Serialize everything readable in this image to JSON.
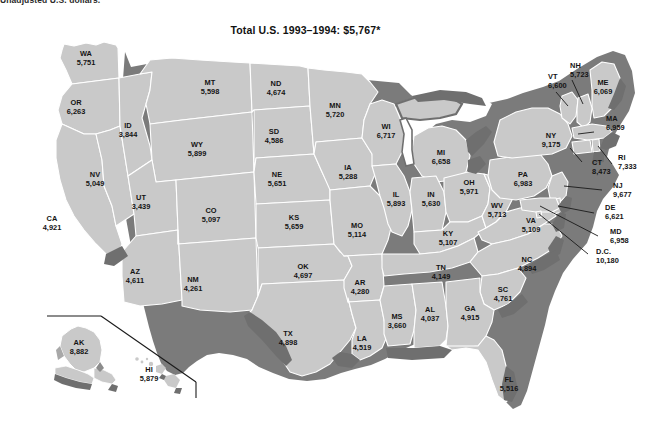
{
  "figure": {
    "footnote_top": "Unadjusted U.S. dollars.",
    "title": "Total U.S. 1993–1994: $5,767*",
    "total_us_value": "5,767",
    "period": "1993–1994",
    "units": "Unadjusted U.S. dollars"
  },
  "colors": {
    "state_fill": "#c9c9c9",
    "state_border": "#ffffff",
    "shadow": "#7b7b7b",
    "water": "#ffffff",
    "text": "#141414",
    "background": "#ffffff"
  },
  "chart_data": {
    "type": "map",
    "title": "Total U.S. 1993–1994: $5,767*",
    "subtitle": "Unadjusted U.S. dollars.",
    "region": "United States",
    "value_label": "Dollars per capita",
    "series_name": "1993–1994",
    "total_us": 5767,
    "min": 3439,
    "max": 10180,
    "categories": [
      "AL",
      "AK",
      "AZ",
      "AR",
      "CA",
      "CO",
      "CT",
      "DE",
      "D.C.",
      "FL",
      "GA",
      "HI",
      "ID",
      "IL",
      "IN",
      "IA",
      "KS",
      "KY",
      "LA",
      "ME",
      "MD",
      "MA",
      "MI",
      "MN",
      "MS",
      "MO",
      "MT",
      "NE",
      "NV",
      "NH",
      "NJ",
      "NM",
      "NY",
      "NC",
      "ND",
      "OH",
      "OK",
      "OR",
      "PA",
      "RI",
      "SC",
      "SD",
      "TN",
      "TX",
      "UT",
      "VT",
      "VA",
      "WA",
      "WV",
      "WI",
      "WY"
    ],
    "values": [
      4037,
      8882,
      4611,
      4280,
      4921,
      5097,
      8473,
      6621,
      10180,
      5516,
      4915,
      5879,
      3844,
      5893,
      5630,
      5288,
      5659,
      5107,
      4519,
      6069,
      6958,
      6959,
      6658,
      5720,
      3660,
      5114,
      5598,
      5651,
      5049,
      5723,
      9677,
      4261,
      9175,
      4894,
      4674,
      5971,
      4697,
      6263,
      6983,
      7333,
      4761,
      4586,
      4149,
      4898,
      3439,
      6600,
      5109,
      5751,
      5713,
      6717,
      5899
    ]
  },
  "states": [
    {
      "id": "WA",
      "abbr": "WA",
      "value": "5,751",
      "x": 86,
      "y": 59,
      "leader": false
    },
    {
      "id": "OR",
      "abbr": "OR",
      "value": "6,263",
      "x": 76,
      "y": 108,
      "leader": false
    },
    {
      "id": "CA",
      "abbr": "CA",
      "value": "4,921",
      "x": 52,
      "y": 224,
      "leader": false
    },
    {
      "id": "NV",
      "abbr": "NV",
      "value": "5,049",
      "x": 95,
      "y": 180,
      "leader": false
    },
    {
      "id": "ID",
      "abbr": "ID",
      "value": "3,844",
      "x": 128,
      "y": 131,
      "leader": false
    },
    {
      "id": "MT",
      "abbr": "MT",
      "value": "5,598",
      "x": 210,
      "y": 88,
      "leader": false
    },
    {
      "id": "WY",
      "abbr": "WY",
      "value": "5,899",
      "x": 197,
      "y": 150,
      "leader": false
    },
    {
      "id": "UT",
      "abbr": "UT",
      "value": "3,439",
      "x": 141,
      "y": 203,
      "leader": false
    },
    {
      "id": "AZ",
      "abbr": "AZ",
      "value": "4,611",
      "x": 135,
      "y": 277,
      "leader": false
    },
    {
      "id": "CO",
      "abbr": "CO",
      "value": "5,097",
      "x": 211,
      "y": 216,
      "leader": false
    },
    {
      "id": "NM",
      "abbr": "NM",
      "value": "4,261",
      "x": 193,
      "y": 285,
      "leader": false
    },
    {
      "id": "ND",
      "abbr": "ND",
      "value": "4,674",
      "x": 276,
      "y": 89,
      "leader": false
    },
    {
      "id": "SD",
      "abbr": "SD",
      "value": "4,586",
      "x": 274,
      "y": 137,
      "leader": false
    },
    {
      "id": "NE",
      "abbr": "NE",
      "value": "5,651",
      "x": 277,
      "y": 180,
      "leader": false
    },
    {
      "id": "KS",
      "abbr": "KS",
      "value": "5,659",
      "x": 294,
      "y": 223,
      "leader": false
    },
    {
      "id": "OK",
      "abbr": "OK",
      "value": "4,697",
      "x": 303,
      "y": 272,
      "leader": false
    },
    {
      "id": "TX",
      "abbr": "TX",
      "value": "4,898",
      "x": 288,
      "y": 339,
      "leader": false
    },
    {
      "id": "MN",
      "abbr": "MN",
      "value": "5,720",
      "x": 335,
      "y": 111,
      "leader": false
    },
    {
      "id": "IA",
      "abbr": "IA",
      "value": "5,288",
      "x": 348,
      "y": 173,
      "leader": false
    },
    {
      "id": "MO",
      "abbr": "MO",
      "value": "5,114",
      "x": 357,
      "y": 231,
      "leader": false
    },
    {
      "id": "AR",
      "abbr": "AR",
      "value": "4,280",
      "x": 360,
      "y": 288,
      "leader": false
    },
    {
      "id": "LA",
      "abbr": "LA",
      "value": "4,519",
      "x": 362,
      "y": 344,
      "leader": false
    },
    {
      "id": "WI",
      "abbr": "WI",
      "value": "6,717",
      "x": 386,
      "y": 132,
      "leader": false
    },
    {
      "id": "IL",
      "abbr": "IL",
      "value": "5,893",
      "x": 396,
      "y": 200,
      "leader": false
    },
    {
      "id": "MS",
      "abbr": "MS",
      "value": "3,660",
      "x": 397,
      "y": 322,
      "leader": false
    },
    {
      "id": "MI",
      "abbr": "MI",
      "value": "6,658",
      "x": 441,
      "y": 158,
      "leader": false
    },
    {
      "id": "IN",
      "abbr": "IN",
      "value": "5,630",
      "x": 431,
      "y": 200,
      "leader": false
    },
    {
      "id": "KY",
      "abbr": "KY",
      "value": "5,107",
      "x": 448,
      "y": 239,
      "leader": false
    },
    {
      "id": "TN",
      "abbr": "TN",
      "value": "4,149",
      "x": 441,
      "y": 273,
      "leader": false
    },
    {
      "id": "AL",
      "abbr": "AL",
      "value": "4,037",
      "x": 430,
      "y": 315,
      "leader": false
    },
    {
      "id": "OH",
      "abbr": "OH",
      "value": "5,971",
      "x": 469,
      "y": 188,
      "leader": false
    },
    {
      "id": "WV",
      "abbr": "WV",
      "value": "5,713",
      "x": 497,
      "y": 211,
      "leader": false
    },
    {
      "id": "GA",
      "abbr": "GA",
      "value": "4,915",
      "x": 470,
      "y": 314,
      "leader": false
    },
    {
      "id": "FL",
      "abbr": "FL",
      "value": "5,516",
      "x": 509,
      "y": 385,
      "leader": false
    },
    {
      "id": "SC",
      "abbr": "SC",
      "value": "4,761",
      "x": 503,
      "y": 295,
      "leader": false
    },
    {
      "id": "NC",
      "abbr": "NC",
      "value": "4,894",
      "x": 527,
      "y": 265,
      "leader": false
    },
    {
      "id": "VA",
      "abbr": "VA",
      "value": "5,109",
      "x": 531,
      "y": 226,
      "leader": false
    },
    {
      "id": "PA",
      "abbr": "PA",
      "value": "6,983",
      "x": 523,
      "y": 180,
      "leader": false
    },
    {
      "id": "NY",
      "abbr": "NY",
      "value": "9,175",
      "x": 551,
      "y": 141,
      "leader": false
    },
    {
      "id": "VT",
      "abbr": "VT",
      "value": "6,600",
      "x": 548,
      "y": 82,
      "leader": true
    },
    {
      "id": "NH",
      "abbr": "NH",
      "value": "5,723",
      "x": 570,
      "y": 71,
      "leader": true
    },
    {
      "id": "ME",
      "abbr": "ME",
      "value": "6,069",
      "x": 603,
      "y": 88,
      "leader": false
    },
    {
      "id": "MA",
      "abbr": "MA",
      "value": "6,959",
      "x": 606,
      "y": 124,
      "leader": true
    },
    {
      "id": "RI",
      "abbr": "RI",
      "value": "7,333",
      "x": 618,
      "y": 163,
      "leader": true
    },
    {
      "id": "CT",
      "abbr": "CT",
      "value": "8,473",
      "x": 592,
      "y": 168,
      "leader": true
    },
    {
      "id": "NJ",
      "abbr": "NJ",
      "value": "9,677",
      "x": 613,
      "y": 191,
      "leader": true
    },
    {
      "id": "DE",
      "abbr": "DE",
      "value": "6,621",
      "x": 605,
      "y": 213,
      "leader": true
    },
    {
      "id": "MD",
      "abbr": "MD",
      "value": "6,958",
      "x": 610,
      "y": 237,
      "leader": true
    },
    {
      "id": "D.C.",
      "abbr": "D.C.",
      "value": "10,180",
      "x": 596,
      "y": 257,
      "leader": true
    },
    {
      "id": "AK",
      "abbr": "AK",
      "value": "8,882",
      "x": 79,
      "y": 348,
      "leader": false
    },
    {
      "id": "HI",
      "abbr": "HI",
      "value": "5,879",
      "x": 149,
      "y": 375,
      "leader": false
    }
  ]
}
